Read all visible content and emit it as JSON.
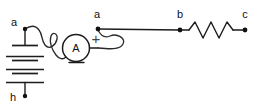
{
  "diagram": {
    "background_color": "#ffffff",
    "stroke_color": "#1c1c1c",
    "width": 258,
    "height": 109,
    "labels": {
      "node_a_left": "a",
      "node_h": "h",
      "node_a_right": "a",
      "node_b": "b",
      "node_c": "c",
      "ammeter": "A",
      "plus_terminal": "+"
    },
    "components": [
      {
        "id": "battery",
        "type": "battery",
        "label": "",
        "terminals": [
          "a",
          "h"
        ],
        "cell_count": 3
      },
      {
        "id": "ammeter",
        "type": "ammeter",
        "label": "A",
        "polarity_marks": [
          "+",
          "-"
        ]
      },
      {
        "id": "resistor",
        "type": "resistor",
        "label": "",
        "terminals": [
          "b",
          "c"
        ],
        "zigzag_peaks": 3
      }
    ],
    "nodes": [
      {
        "id": "a-left",
        "label": "a",
        "x": 25,
        "y": 29
      },
      {
        "id": "h",
        "label": "h",
        "x": 25,
        "y": 96
      },
      {
        "id": "a-right",
        "label": "a",
        "x": 98,
        "y": 29
      },
      {
        "id": "b",
        "label": "b",
        "x": 180,
        "y": 29
      },
      {
        "id": "c",
        "label": "c",
        "x": 245,
        "y": 29
      }
    ]
  }
}
